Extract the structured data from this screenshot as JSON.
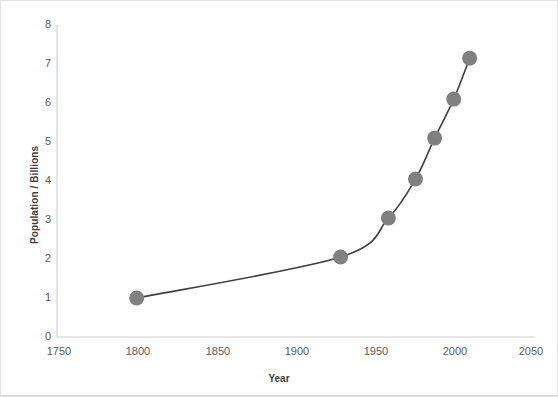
{
  "chart_data": {
    "type": "line",
    "title": "",
    "subtitle": "",
    "xlabel": "Year",
    "ylabel": "Population / Billions",
    "xlim": [
      1750,
      2050
    ],
    "ylim": [
      0,
      8
    ],
    "grid": false,
    "legend": false,
    "legend_position": "none",
    "xticks": [
      1750,
      1800,
      1850,
      1900,
      1950,
      2000,
      2050
    ],
    "xtick_labels": [
      "1750",
      "1800",
      "1850",
      "1900",
      "1950",
      "2000",
      "2050"
    ],
    "yticks": [
      0,
      1,
      2,
      3,
      4,
      5,
      6,
      7,
      8
    ],
    "ytick_labels": [
      "0",
      "1",
      "2",
      "3",
      "4",
      "5",
      "6",
      "7",
      "8"
    ],
    "marker_color": "#808080",
    "line_color": "#3f3f3f",
    "axis_color": "#d0d0d0",
    "text_color": "#5a5a5a",
    "series": [
      {
        "name": "World population",
        "x": [
          1800,
          1928,
          1958,
          1975,
          1987,
          1999,
          2009
        ],
        "values": [
          1.0,
          2.05,
          3.05,
          4.05,
          5.1,
          6.1,
          7.15
        ]
      }
    ]
  },
  "axes": {
    "y_title": "Population / Billions",
    "x_title": "Year"
  }
}
